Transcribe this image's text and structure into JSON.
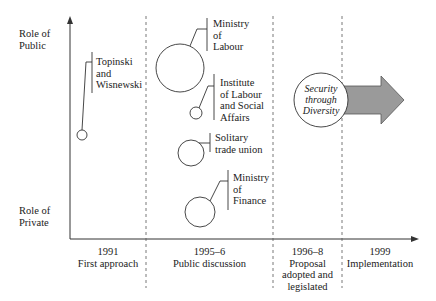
{
  "axes": {
    "y_top_label_line1": "Role of",
    "y_top_label_line2": "Public",
    "y_bottom_label_line1": "Role of",
    "y_bottom_label_line2": "Private"
  },
  "phases": [
    {
      "year": "1991",
      "line1": "First approach",
      "line2": "",
      "line3": ""
    },
    {
      "year": "1995–6",
      "line1": "Public discussion",
      "line2": "",
      "line3": ""
    },
    {
      "year": "1996–8",
      "line1": "Proposal",
      "line2": "adopted and",
      "line3": "legislated"
    },
    {
      "year": "1999",
      "line1": "Implementation",
      "line2": "",
      "line3": ""
    }
  ],
  "actors": [
    {
      "name_l1": "Topinski",
      "name_l2": "and",
      "name_l3": "Wisnewski",
      "phase": "1991"
    },
    {
      "name_l1": "Ministry",
      "name_l2": "of",
      "name_l3": "Labour",
      "phase": "1995–6"
    },
    {
      "name_l1": "Institute",
      "name_l2": "of Labour",
      "name_l3": "and Social",
      "name_l4": "Affairs",
      "phase": "1995–6"
    },
    {
      "name_l1": "Solitary",
      "name_l2": "trade union",
      "phase": "1995–6"
    },
    {
      "name_l1": "Ministry",
      "name_l2": "of",
      "name_l3": "Finance",
      "phase": "1995–6"
    }
  ],
  "outcome": {
    "line1": "Security",
    "line2": "through",
    "line3": "Diversity"
  },
  "colors": {
    "line": "#333333",
    "arrow_fill": "#9a9a9a",
    "arrow_stroke": "#555555"
  }
}
